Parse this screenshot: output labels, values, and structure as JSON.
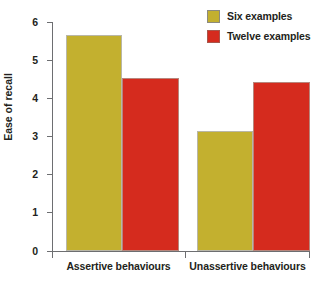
{
  "chart_data": {
    "type": "bar",
    "title": "",
    "xlabel": "",
    "ylabel": "Ease of recall",
    "categories": [
      "Assertive behaviours",
      "Unassertive behaviours"
    ],
    "series": [
      {
        "name": "Six examples",
        "color": "#c3b02f",
        "values": [
          5.65,
          3.13
        ]
      },
      {
        "name": "Twelve examples",
        "color": "#d52b1e",
        "values": [
          4.52,
          4.42
        ]
      }
    ],
    "ylim": [
      0,
      6
    ],
    "y_ticks": [
      0,
      1,
      2,
      3,
      4,
      5,
      6
    ],
    "y_tick_labels": [
      "0",
      "1",
      "2",
      "3",
      "4",
      "5",
      "6"
    ],
    "grid": false,
    "legend_position": "top-right"
  },
  "legend": {
    "entries": [
      {
        "label": "Six examples",
        "swatch": "legend-swatch-six-examples"
      },
      {
        "label": "Twelve examples",
        "swatch": "legend-swatch-twelve-examples"
      }
    ]
  },
  "axes": {
    "y_title": "Ease of recall",
    "y_labels": [
      "6",
      "5",
      "4",
      "3",
      "2",
      "1",
      "0"
    ],
    "x_labels": [
      "Assertive behaviours",
      "Unassertive behaviours"
    ]
  }
}
